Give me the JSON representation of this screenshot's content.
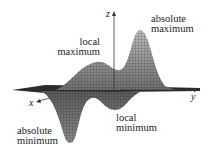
{
  "diagram": {
    "type": "3d-surface-plot",
    "axes": {
      "x": "x",
      "y": "y",
      "z": "z"
    },
    "annotations": [
      {
        "id": "absolute-maximum",
        "line1": "absolute",
        "line2": "maximum"
      },
      {
        "id": "local-maximum",
        "line1": "local",
        "line2": "maximum"
      },
      {
        "id": "local-minimum",
        "line1": "local",
        "line2": "minimum"
      },
      {
        "id": "absolute-minimum",
        "line1": "absolute",
        "line2": "minimum"
      }
    ],
    "colors": {
      "surface": "#9a9a9a",
      "mesh": "#2a2a2a",
      "text": "#222222",
      "axis": "#333333"
    }
  }
}
